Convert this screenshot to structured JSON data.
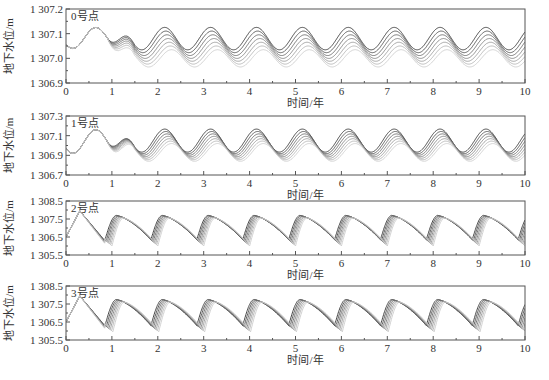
{
  "figure": {
    "xlabel": "时间/年",
    "ylabel": "地下水位/m",
    "line_colors": [
      "#333333",
      "#4d4d4d",
      "#666666",
      "#7f7f7f",
      "#999999",
      "#b3b3b3",
      "#cccccc"
    ]
  },
  "chart_data": [
    {
      "type": "line",
      "title": "0号点",
      "xlabel": "时间/年",
      "ylabel": "地下水位/m",
      "xlim": [
        0,
        10
      ],
      "ylim": [
        1306.9,
        1307.2
      ],
      "xticks": [
        "0",
        "1",
        "2",
        "3",
        "4",
        "5",
        "6",
        "7",
        "8",
        "9",
        "10"
      ],
      "yticks": [
        "1 306.9",
        "1 307.0",
        "1 307.1",
        "1 307.2"
      ],
      "pattern": "sinusoidal",
      "period_years": 1,
      "series_count": 7,
      "grid": false,
      "initial": {
        "t0": 1307.05,
        "trough_t": 0.15,
        "trough": 1307.04,
        "peak_t": 0.65,
        "peak": 1307.125
      },
      "steady_state": {
        "mean_range": [
          1307.0,
          1307.08
        ],
        "amplitude": 0.035,
        "spread_between_series": 0.015
      }
    },
    {
      "type": "line",
      "title": "1号点",
      "xlabel": "时间/年",
      "ylabel": "地下水位/m",
      "xlim": [
        0,
        10
      ],
      "ylim": [
        1306.7,
        1307.3
      ],
      "xticks": [
        "0",
        "1",
        "2",
        "3",
        "4",
        "5",
        "6",
        "7",
        "8",
        "9",
        "10"
      ],
      "yticks": [
        "1 306.7",
        "1 306.9",
        "1 307.1",
        "1 307.3"
      ],
      "pattern": "sinusoidal",
      "period_years": 1,
      "series_count": 7,
      "grid": false,
      "initial": {
        "t0": 1306.98,
        "trough_t": 0.15,
        "trough": 1306.92,
        "peak_t": 0.7,
        "peak": 1307.16
      },
      "steady_state": {
        "mean_range": [
          1306.93,
          1307.05
        ],
        "amplitude": 0.09,
        "spread_between_series": 0.03
      }
    },
    {
      "type": "line",
      "title": "2号点",
      "xlabel": "时间/年",
      "ylabel": "地下水位/m",
      "xlim": [
        0,
        10
      ],
      "ylim": [
        1305.5,
        1308.5
      ],
      "xticks": [
        "0",
        "1",
        "2",
        "3",
        "4",
        "5",
        "6",
        "7",
        "8",
        "9",
        "10"
      ],
      "yticks": [
        "1 305.5",
        "1 306.5",
        "1 307.5",
        "1 308.5"
      ],
      "pattern": "sawtooth",
      "period_years": 1,
      "series_count": 7,
      "grid": false,
      "initial": {
        "t0": 1306.5,
        "peak_t": 0.3,
        "peak": 1307.95,
        "trough_t": 0.9,
        "trough": 1306.2
      },
      "steady_state": {
        "peak": 1307.7,
        "trough": 1306.0,
        "phase_spread_years": 0.15
      }
    },
    {
      "type": "line",
      "title": "3号点",
      "xlabel": "时间/年",
      "ylabel": "地下水位/m",
      "xlim": [
        0,
        10
      ],
      "ylim": [
        1305.5,
        1308.5
      ],
      "xticks": [
        "0",
        "1",
        "2",
        "3",
        "4",
        "5",
        "6",
        "7",
        "8",
        "9",
        "10"
      ],
      "yticks": [
        "1 305.5",
        "1 306.5",
        "1 307.5",
        "1 308.5"
      ],
      "pattern": "sawtooth",
      "period_years": 1,
      "series_count": 7,
      "grid": false,
      "initial": {
        "t0": 1306.5,
        "peak_t": 0.3,
        "peak": 1307.95,
        "trough_t": 0.9,
        "trough": 1306.2
      },
      "steady_state": {
        "peak": 1307.75,
        "trough": 1305.95,
        "phase_spread_years": 0.17
      }
    }
  ],
  "panels": [
    {
      "label": "0号点",
      "yticks": [
        "1 307.2",
        "1 307.1",
        "1 307.0",
        "1 306.9"
      ]
    },
    {
      "label": "1号点",
      "yticks": [
        "1 307.3",
        "1 307.1",
        "1 306.9",
        "1 306.7"
      ]
    },
    {
      "label": "2号点",
      "yticks": [
        "1 308.5",
        "1 307.5",
        "1 306.5",
        "1 305.5"
      ]
    },
    {
      "label": "3号点",
      "yticks": [
        "1 308.5",
        "1 307.5",
        "1 306.5",
        "1 305.5"
      ]
    }
  ],
  "xticks": [
    "0",
    "1",
    "2",
    "3",
    "4",
    "5",
    "6",
    "7",
    "8",
    "9",
    "10"
  ]
}
